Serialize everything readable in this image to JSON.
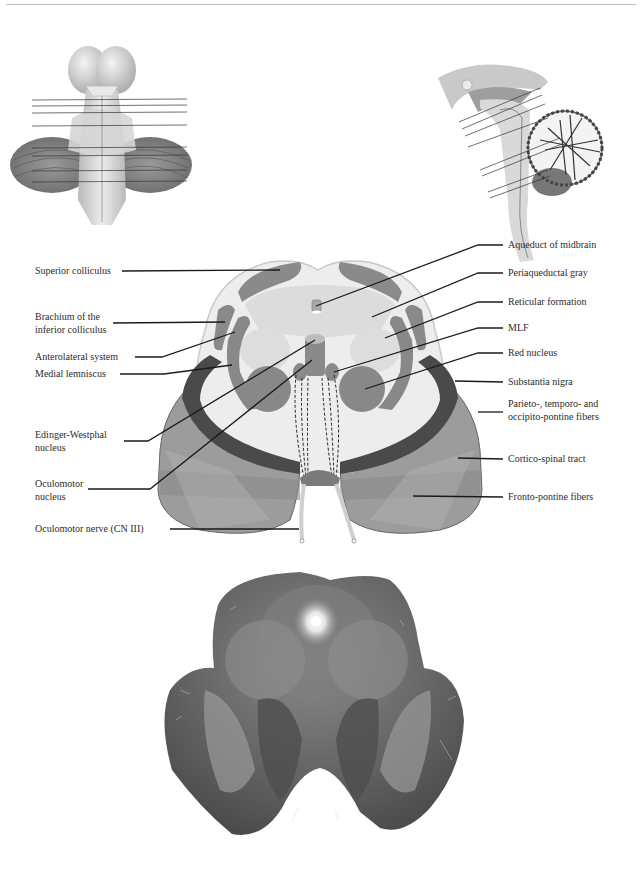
{
  "header": {
    "text": "Midbrain: Upper"
  },
  "thumbnails": {
    "dorsal_view": {
      "name": "brainstem-dorsal-view-thumbnail",
      "level_lines": 8
    },
    "sagittal_view": {
      "name": "brainstem-sagittal-view-thumbnail",
      "level_lines": 8
    }
  },
  "diagram": {
    "left_labels": [
      {
        "id": "superior-colliculus",
        "lines": [
          "Superior colliculus"
        ]
      },
      {
        "id": "brachium-inferior-colliculus",
        "lines": [
          "Brachium of the",
          "inferior colliculus"
        ]
      },
      {
        "id": "anterolateral-system",
        "lines": [
          "Anterolateral system"
        ]
      },
      {
        "id": "medial-lemniscus",
        "lines": [
          "Medial lemniscus"
        ]
      },
      {
        "id": "edinger-westphal-nucleus",
        "lines": [
          "Edinger-Westphal",
          "nucleus"
        ]
      },
      {
        "id": "oculomotor-nucleus",
        "lines": [
          "Oculomotor",
          "nucleus"
        ]
      },
      {
        "id": "oculomotor-nerve",
        "lines": [
          "Oculomotor nerve (CN III)"
        ]
      }
    ],
    "right_labels": [
      {
        "id": "aqueduct-of-midbrain",
        "lines": [
          "Aqueduct of midbrain"
        ]
      },
      {
        "id": "periaqueductal-gray",
        "lines": [
          "Periaqueductal gray"
        ]
      },
      {
        "id": "reticular-formation",
        "lines": [
          "Reticular formation"
        ]
      },
      {
        "id": "mlf",
        "lines": [
          "MLF"
        ]
      },
      {
        "id": "red-nucleus",
        "lines": [
          "Red nucleus"
        ]
      },
      {
        "id": "substantia-nigra",
        "lines": [
          "Substantia nigra"
        ]
      },
      {
        "id": "parieto-temporo-occipito-pontine-fibers",
        "lines": [
          "Parieto-, temporo- and",
          "occipito-pontine fibers"
        ]
      },
      {
        "id": "cortico-spinal-tract",
        "lines": [
          "Cortico-spinal tract"
        ]
      },
      {
        "id": "fronto-pontine-fibers",
        "lines": [
          "Fronto-pontine fibers"
        ]
      }
    ]
  },
  "histology": {
    "name": "stained-midbrain-section-photo",
    "description": "Myelin-stained transverse section of upper midbrain"
  },
  "colors": {
    "white_matter": "#ececec",
    "tegmentum_light": "#d9d9d9",
    "nucleus_gray": "#8a8a8a",
    "substantia_nigra": "#4a4a4a",
    "peduncle": "#9c9c9c",
    "peduncle_dark": "#7a7a7a",
    "leader_line": "#1a1a1a",
    "histology_dark": "#3f3f3f",
    "histology_mid": "#7c7c7c"
  }
}
